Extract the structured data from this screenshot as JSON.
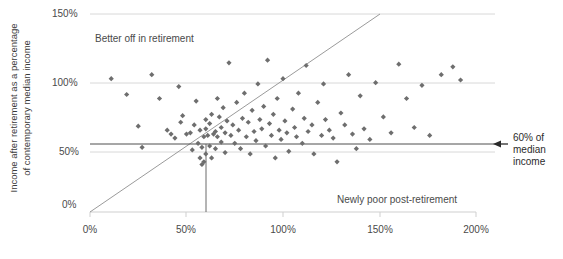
{
  "chart_data": {
    "type": "scatter",
    "title": "",
    "xlabel": "",
    "ylabel": "Income after retirement as a percentage\nof contemporary median income",
    "xlim": [
      0,
      200
    ],
    "ylim": [
      0,
      150
    ],
    "xticks": [
      "0%",
      "50%",
      "100%",
      "150%",
      "200%"
    ],
    "xtick_values": [
      0,
      50,
      100,
      150,
      200
    ],
    "yticks": [
      "0%",
      "50%",
      "100%",
      "150%"
    ],
    "ytick_values": [
      0,
      50,
      100,
      150
    ],
    "grid": "horizontal",
    "legend": "none",
    "marker": "diamond",
    "marker_color": "#6e6e6e",
    "annotations": [
      {
        "id": "better-off",
        "text": "Better off in retirement",
        "x": 35,
        "y": 133
      },
      {
        "id": "newly-poor",
        "text": "Newly poor post-retirement",
        "x": 130,
        "y": 9
      },
      {
        "id": "median-callout",
        "text": "60% of\nmedian income",
        "x": 205,
        "y": 60
      }
    ],
    "reference_lines": [
      {
        "id": "identity-line",
        "type": "diagonal",
        "from": [
          0,
          0
        ],
        "to": [
          150,
          150
        ],
        "color": "#8a8a8a"
      },
      {
        "id": "horizontal-60-line",
        "type": "horizontal",
        "value": 60,
        "color": "#555555"
      },
      {
        "id": "vertical-60-line",
        "type": "vertical",
        "value": 60,
        "color": "#555555"
      }
    ],
    "points": [
      [
        11,
        101
      ],
      [
        19,
        89
      ],
      [
        25,
        65
      ],
      [
        27,
        49
      ],
      [
        32,
        104
      ],
      [
        36,
        86
      ],
      [
        40,
        62
      ],
      [
        42,
        59
      ],
      [
        44,
        56
      ],
      [
        46,
        95
      ],
      [
        47,
        68
      ],
      [
        48,
        73
      ],
      [
        50,
        59
      ],
      [
        52,
        60
      ],
      [
        53,
        47
      ],
      [
        54,
        66
      ],
      [
        55,
        84
      ],
      [
        56,
        52
      ],
      [
        57,
        62
      ],
      [
        57,
        41
      ],
      [
        58,
        49
      ],
      [
        58,
        36
      ],
      [
        59,
        38
      ],
      [
        59,
        57
      ],
      [
        60,
        44
      ],
      [
        60,
        63
      ],
      [
        60,
        70
      ],
      [
        61,
        58
      ],
      [
        62,
        50
      ],
      [
        62,
        67
      ],
      [
        63,
        74
      ],
      [
        63,
        41
      ],
      [
        64,
        59
      ],
      [
        65,
        61
      ],
      [
        65,
        48
      ],
      [
        66,
        57
      ],
      [
        66,
        86
      ],
      [
        67,
        72
      ],
      [
        68,
        53
      ],
      [
        68,
        64
      ],
      [
        69,
        79
      ],
      [
        70,
        60
      ],
      [
        70,
        45
      ],
      [
        71,
        69
      ],
      [
        72,
        113
      ],
      [
        73,
        58
      ],
      [
        74,
        66
      ],
      [
        75,
        52
      ],
      [
        76,
        83
      ],
      [
        77,
        62
      ],
      [
        78,
        48
      ],
      [
        79,
        71
      ],
      [
        80,
        90
      ],
      [
        81,
        57
      ],
      [
        82,
        68
      ],
      [
        83,
        44
      ],
      [
        84,
        77
      ],
      [
        85,
        61
      ],
      [
        86,
        54
      ],
      [
        87,
        97
      ],
      [
        88,
        70
      ],
      [
        89,
        63
      ],
      [
        90,
        80
      ],
      [
        91,
        50
      ],
      [
        92,
        115
      ],
      [
        93,
        67
      ],
      [
        94,
        58
      ],
      [
        95,
        74
      ],
      [
        96,
        41
      ],
      [
        97,
        86
      ],
      [
        98,
        62
      ],
      [
        99,
        55
      ],
      [
        100,
        101
      ],
      [
        101,
        69
      ],
      [
        102,
        60
      ],
      [
        103,
        46
      ],
      [
        105,
        78
      ],
      [
        106,
        64
      ],
      [
        107,
        57
      ],
      [
        108,
        90
      ],
      [
        110,
        52
      ],
      [
        111,
        71
      ],
      [
        112,
        111
      ],
      [
        113,
        61
      ],
      [
        115,
        66
      ],
      [
        116,
        44
      ],
      [
        118,
        83
      ],
      [
        120,
        58
      ],
      [
        121,
        97
      ],
      [
        122,
        70
      ],
      [
        124,
        62
      ],
      [
        126,
        56
      ],
      [
        128,
        38
      ],
      [
        130,
        75
      ],
      [
        132,
        66
      ],
      [
        134,
        104
      ],
      [
        136,
        59
      ],
      [
        138,
        48
      ],
      [
        140,
        88
      ],
      [
        142,
        63
      ],
      [
        145,
        55
      ],
      [
        148,
        98
      ],
      [
        152,
        72
      ],
      [
        156,
        60
      ],
      [
        160,
        112
      ],
      [
        164,
        86
      ],
      [
        168,
        64
      ],
      [
        172,
        96
      ],
      [
        176,
        58
      ],
      [
        182,
        104
      ],
      [
        188,
        110
      ],
      [
        192,
        100
      ]
    ]
  }
}
